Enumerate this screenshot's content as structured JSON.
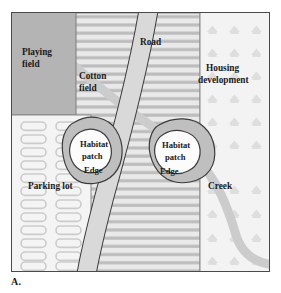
{
  "figure": {
    "panel_letter": "A.",
    "frame": {
      "x": 11,
      "y": 12,
      "width": 259,
      "height": 260
    }
  },
  "colors": {
    "playing_field_fill": "#b3b3b3",
    "cotton_field_fill": "#e6e6e6",
    "cotton_row_stripe": "#b9b9b9",
    "parking_lot_fill": "#f2f2f2",
    "parking_space_stroke": "#c9c9c9",
    "housing_fill": "#f0f0f0",
    "house_icon_fill": "#e0e0e0",
    "road_fill": "#d8d8d8",
    "road_stroke": "#3a3a3a",
    "creek_fill": "#c8c8c8",
    "habitat_edge_fill": "#bdbdbd",
    "habitat_core_fill": "#fcfcfc",
    "outline": "#4a4a4a",
    "text": "#1a1a1a"
  },
  "regions": [
    {
      "id": "playing-field",
      "label_lines": [
        "Playing",
        "field"
      ]
    },
    {
      "id": "cotton-field",
      "label_lines": [
        "Cotton",
        "field"
      ]
    },
    {
      "id": "housing-development",
      "label_lines": [
        "Housing",
        "development"
      ]
    },
    {
      "id": "parking-lot",
      "label_lines": [
        "Parking lot"
      ]
    }
  ],
  "labels": {
    "playing_field_line1": "Playing",
    "playing_field_line2": "field",
    "cotton_field_line1": "Cotton",
    "cotton_field_line2": "field",
    "housing_line1": "Housing",
    "housing_line2": "development",
    "parking_lot": "Parking lot",
    "road": "Road",
    "creek": "Creek",
    "habitat_left_line1": "Habitat",
    "habitat_left_line2": "patch",
    "habitat_left_edge": "Edge",
    "habitat_right_line1": "Habitat",
    "habitat_right_line2": "patch",
    "habitat_right_edge": "Edge"
  },
  "features": {
    "road": {
      "name": "Road",
      "type": "linear-corridor",
      "orientation": "runs from top-center down to bottom-left"
    },
    "creek": {
      "name": "Creek",
      "type": "waterway",
      "orientation": "runs from top-left diagonally to bottom-right corner"
    },
    "habitat_patches": [
      {
        "name": "Habitat patch",
        "edge_label": "Edge",
        "position": "left-center"
      },
      {
        "name": "Habitat patch",
        "edge_label": "Edge",
        "position": "right-center"
      }
    ]
  },
  "parking_lot": {
    "columns": 2,
    "rows": 13,
    "spaces_total": 26,
    "label_row_index": 6
  },
  "cotton_field": {
    "crop_rows": 24
  },
  "housing_development": {
    "house_icon_columns": 3,
    "house_icon_rows": 9,
    "icon_name": "house-icon"
  }
}
